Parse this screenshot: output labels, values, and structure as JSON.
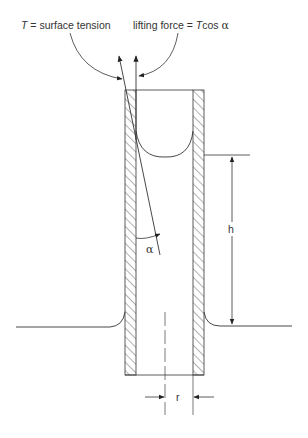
{
  "diagram": {
    "labels": {
      "tension_prefix": "T",
      "tension_text": " = surface tension",
      "lifting_text": "lifting force = ",
      "lifting_T": "T",
      "lifting_cos": "cos ",
      "lifting_alpha": "α",
      "angle": "α",
      "height": "h",
      "radius": "r"
    },
    "colors": {
      "line": "#333333",
      "hatch": "#444444",
      "background": "#ffffff"
    }
  }
}
